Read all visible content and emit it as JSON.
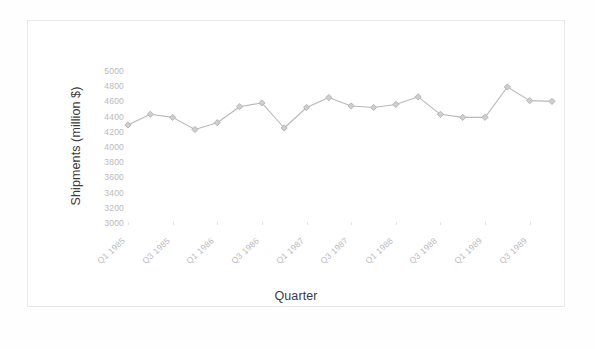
{
  "chart_data": {
    "type": "line",
    "title": "",
    "xlabel": "Quarter",
    "ylabel": "Shipments (million $)",
    "ylim": [
      3000,
      5000
    ],
    "yticks": [
      5000,
      4800,
      4600,
      4400,
      4200,
      4000,
      3800,
      3600,
      3400,
      3200,
      3000
    ],
    "grid": false,
    "legend": false,
    "categories": [
      "Q1 1985",
      "Q2 1985",
      "Q3 1985",
      "Q4 1985",
      "Q1 1986",
      "Q2 1986",
      "Q3 1986",
      "Q4 1986",
      "Q1 1987",
      "Q2 1987",
      "Q3 1987",
      "Q4 1987",
      "Q1 1988",
      "Q2 1988",
      "Q3 1988",
      "Q4 1988",
      "Q1 1989",
      "Q2 1989",
      "Q3 1989",
      "Q4 1989"
    ],
    "xtick_labels": [
      "Q1 1985",
      "Q3 1985",
      "Q1 1986",
      "Q3 1986",
      "Q1 1987",
      "Q3 1987",
      "Q1 1988",
      "Q3 1988",
      "Q1 1989",
      "Q3 1989"
    ],
    "values": [
      4290,
      4430,
      4390,
      4230,
      4320,
      4530,
      4580,
      4250,
      4520,
      4650,
      4540,
      4520,
      4560,
      4660,
      4430,
      4390,
      4390,
      4790,
      4610,
      4600
    ],
    "series": [
      {
        "name": "Shipments",
        "values": [
          4290,
          4430,
          4390,
          4230,
          4320,
          4530,
          4580,
          4250,
          4520,
          4650,
          4540,
          4520,
          4560,
          4660,
          4430,
          4390,
          4390,
          4790,
          4610,
          4600
        ],
        "color": "#b0b0b4",
        "marker": "diamond"
      }
    ]
  },
  "axis": {
    "y_title": "Shipments (million $)",
    "x_title": "Quarter"
  }
}
